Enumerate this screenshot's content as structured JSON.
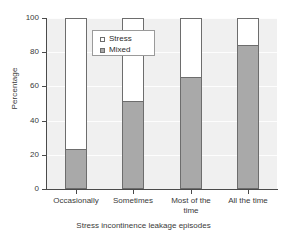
{
  "chart_data": {
    "type": "bar",
    "subtype": "stacked-percentage",
    "title": "",
    "xlabel": "Stress incontinence leakage episodes",
    "ylabel": "Percentage",
    "categories": [
      "Occasionally",
      "Sometimes",
      "Most of the time",
      "All the time"
    ],
    "series": [
      {
        "name": "Stress",
        "color": "#ffffff",
        "values": [
          76.5,
          48.5,
          34.5,
          16.0
        ]
      },
      {
        "name": "Mixed",
        "color": "#a9a9a9",
        "values": [
          23.5,
          51.5,
          65.5,
          84.0
        ]
      }
    ],
    "stack_order": [
      "Mixed",
      "Stress"
    ],
    "ylim": [
      0,
      100
    ],
    "yticks": [
      0,
      20,
      40,
      60,
      80,
      100
    ],
    "ytick_labels": [
      "0",
      "20",
      "40",
      "60",
      "80",
      "100"
    ],
    "grid": true,
    "legend_position": "top-center"
  },
  "legend": {
    "entries": [
      {
        "label": "Stress",
        "swatch": "white-square-swatch"
      },
      {
        "label": "Mixed",
        "swatch": "gray-square-swatch"
      }
    ]
  },
  "axes": {
    "y_title": "Percentage",
    "x_title": "Stress incontinence leakage episodes",
    "y_labels": [
      "100",
      "80",
      "60",
      "40",
      "20",
      "0"
    ],
    "x_labels": [
      "Occasionally",
      "Sometimes",
      "Most of the\ntime",
      "All the time"
    ]
  }
}
